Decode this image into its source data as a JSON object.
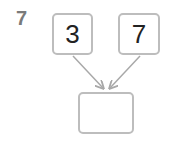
{
  "question": {
    "number": "7"
  },
  "diagram": {
    "inputs": [
      {
        "value": "3"
      },
      {
        "value": "7"
      }
    ],
    "result": {
      "value": ""
    },
    "colors": {
      "border": "#bdbdbd",
      "arrow": "#a8a8a8",
      "number": "#7a7a7a",
      "text": "#222222"
    }
  }
}
